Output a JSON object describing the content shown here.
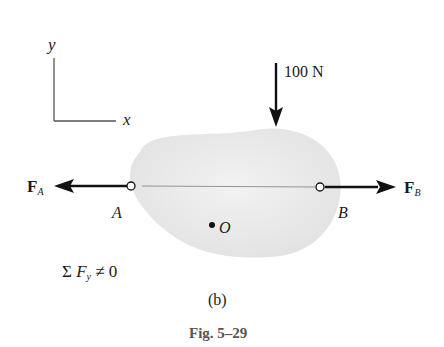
{
  "figure": {
    "caption": "Fig. 5–29",
    "subfigure_label": "(b)"
  },
  "axes": {
    "x_label": "x",
    "y_label": "y"
  },
  "loads": {
    "applied_force": "100 N",
    "force_a": {
      "symbol": "F",
      "subscript": "A"
    },
    "force_b": {
      "symbol": "F",
      "subscript": "B"
    }
  },
  "points": {
    "a": "A",
    "b": "B",
    "o": "O"
  },
  "equation": {
    "sigma": "Σ",
    "f": "F",
    "sub": "y",
    "rest": " ≠ 0"
  },
  "colors": {
    "body_fill": "#e9e9e9",
    "line": "#111111",
    "axis": "#555555"
  }
}
